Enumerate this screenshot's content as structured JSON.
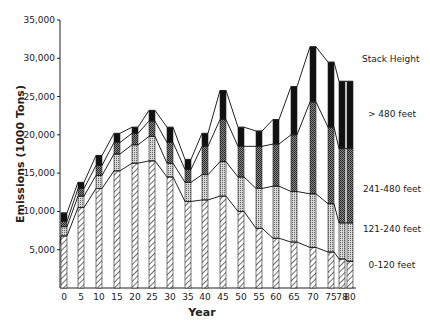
{
  "chart_data": {
    "type": "bar",
    "subtype": "stacked-bar-with-connecting-lines",
    "title": "",
    "xlabel": "Year",
    "ylabel": "Emissions (1000 Tons)",
    "ylim": [
      0,
      35000
    ],
    "yticks": [
      5000,
      10000,
      15000,
      20000,
      25000,
      30000,
      35000
    ],
    "ytick_labels": [
      "5,000",
      "10,000",
      "15,000",
      "20,000",
      "25,000",
      "30,000",
      "35,000"
    ],
    "categories": [
      "0",
      "5",
      "10",
      "15",
      "20",
      "25",
      "30",
      "35",
      "40",
      "45",
      "50",
      "55",
      "60",
      "65",
      "70",
      "75",
      "78",
      "80"
    ],
    "legend_title": "Stack Height",
    "legend_position": "right",
    "grid": false,
    "series": [
      {
        "name": "0-120 feet",
        "pattern": "diagonal-hatch",
        "values": [
          6800,
          10500,
          13000,
          15300,
          16300,
          16600,
          14500,
          11300,
          11500,
          12000,
          10000,
          7800,
          6500,
          6000,
          5300,
          4700,
          3800,
          3500
        ]
      },
      {
        "name": "121-240 feet",
        "pattern": "light-stipple",
        "values": [
          1200,
          1500,
          1700,
          2200,
          2400,
          3200,
          1800,
          2500,
          3300,
          4500,
          4500,
          5200,
          6800,
          6600,
          7000,
          6300,
          4700,
          5000
        ]
      },
      {
        "name": "241-480 feet",
        "pattern": "dark-stipple",
        "values": [
          700,
          1000,
          1300,
          1500,
          1500,
          2000,
          2700,
          1700,
          3700,
          5500,
          4000,
          5500,
          5500,
          7400,
          12000,
          10000,
          9700,
          9700
        ]
      },
      {
        "name": "> 480 feet",
        "pattern": "solid-black",
        "values": [
          1100,
          800,
          1300,
          1200,
          800,
          1400,
          2000,
          1300,
          1700,
          3800,
          2500,
          2000,
          3200,
          6300,
          7200,
          8500,
          8800,
          8800
        ]
      }
    ],
    "totals": [
      9800,
      13800,
      17300,
      20200,
      21000,
      23200,
      21000,
      16800,
      20200,
      25800,
      21000,
      20500,
      22000,
      26300,
      31500,
      29500,
      27000,
      27000
    ]
  },
  "labels": {
    "legend_title": "Stack Height",
    "xlabel": "Year",
    "ylabel": "Emissions (1000 Tons)"
  }
}
